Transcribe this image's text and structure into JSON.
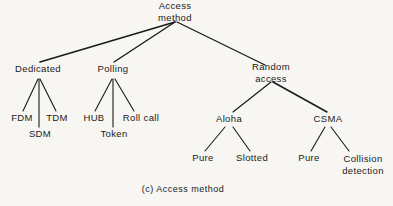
{
  "figure": {
    "caption": "(c) Access method",
    "background_color": "#f7f6f3",
    "ink_color": "#1a1a1a"
  },
  "tree": {
    "root": {
      "label": "Access method",
      "x": 175,
      "y": 11
    },
    "level2": [
      {
        "label": "Dedicated",
        "x": 38,
        "y": 69
      },
      {
        "label": "Polling",
        "x": 113,
        "y": 69
      },
      {
        "label": "Random access",
        "x": 271,
        "y": 72
      }
    ],
    "level3": [
      {
        "label": "FDM",
        "x": 22,
        "y": 118
      },
      {
        "label": "SDM",
        "x": 40,
        "y": 134
      },
      {
        "label": "TDM",
        "x": 57,
        "y": 118
      },
      {
        "label": "HUB",
        "x": 94,
        "y": 118
      },
      {
        "label": "Token",
        "x": 114,
        "y": 134
      },
      {
        "label": "Roll call",
        "x": 141,
        "y": 118
      },
      {
        "label": "Aloha",
        "x": 229,
        "y": 119
      },
      {
        "label": "CSMA",
        "x": 328,
        "y": 119
      }
    ],
    "level4": [
      {
        "label": "Pure",
        "x": 203,
        "y": 158
      },
      {
        "label": "Slotted",
        "x": 252,
        "y": 158
      },
      {
        "label": "Pure",
        "x": 309,
        "y": 158
      },
      {
        "label": "Collision detection",
        "x": 363,
        "y": 164
      }
    ]
  },
  "edges": [
    {
      "name": "root-to-dedicated",
      "x1": 175,
      "y1": 22,
      "x2": 40,
      "y2": 62,
      "w": 1.6
    },
    {
      "name": "root-to-polling",
      "x1": 175,
      "y1": 22,
      "x2": 114,
      "y2": 62,
      "w": 1.4
    },
    {
      "name": "root-to-random-access",
      "x1": 177,
      "y1": 22,
      "x2": 265,
      "y2": 65,
      "w": 1.3
    },
    {
      "name": "dedicated-to-fdm",
      "x1": 38,
      "y1": 79,
      "x2": 23,
      "y2": 111,
      "w": 1.1
    },
    {
      "name": "dedicated-to-sdm",
      "x1": 39,
      "y1": 79,
      "x2": 39,
      "y2": 127,
      "w": 1.1
    },
    {
      "name": "dedicated-to-tdm",
      "x1": 40,
      "y1": 79,
      "x2": 56,
      "y2": 111,
      "w": 1.1
    },
    {
      "name": "polling-to-hub",
      "x1": 112,
      "y1": 79,
      "x2": 95,
      "y2": 111,
      "w": 1.1
    },
    {
      "name": "polling-to-token",
      "x1": 113,
      "y1": 79,
      "x2": 113,
      "y2": 127,
      "w": 1.1
    },
    {
      "name": "polling-to-roll-call",
      "x1": 115,
      "y1": 79,
      "x2": 134,
      "y2": 111,
      "w": 1.1
    },
    {
      "name": "random-access-to-aloha",
      "x1": 271,
      "y1": 82,
      "x2": 233,
      "y2": 112,
      "w": 1.2
    },
    {
      "name": "random-access-to-csma",
      "x1": 273,
      "y1": 82,
      "x2": 327,
      "y2": 112,
      "w": 1.5
    },
    {
      "name": "aloha-to-pure",
      "x1": 225,
      "y1": 127,
      "x2": 205,
      "y2": 151,
      "w": 1.1
    },
    {
      "name": "aloha-to-slotted",
      "x1": 233,
      "y1": 127,
      "x2": 250,
      "y2": 151,
      "w": 1.1
    },
    {
      "name": "csma-to-pure",
      "x1": 325,
      "y1": 127,
      "x2": 311,
      "y2": 151,
      "w": 1.1
    },
    {
      "name": "csma-to-collision-detection",
      "x1": 331,
      "y1": 127,
      "x2": 349,
      "y2": 151,
      "w": 1.1
    }
  ],
  "caption_position": {
    "x": 183,
    "y": 189
  }
}
